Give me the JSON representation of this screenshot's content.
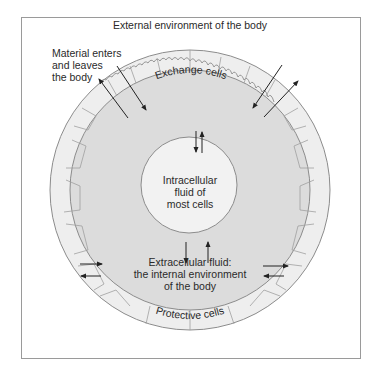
{
  "title": "External environment of the body",
  "labels": {
    "material_line1": "Material enters",
    "material_line2": "and leaves",
    "material_line3": "the body",
    "exchange_cells": "Exchange cells",
    "intracellular_line1": "Intracellular",
    "intracellular_line2": "fluid of",
    "intracellular_line3": "most cells",
    "extracellular_line1": "Extracellular fluid:",
    "extracellular_line2": "the internal environment",
    "extracellular_line3": "of the body",
    "protective_cells": "Protective cells"
  },
  "colors": {
    "frame_border": "#9a9a9a",
    "cell_layer_fill": "#eeeeee",
    "extracellular_fill": "#dcdcdc",
    "intracellular_fill": "#f2f2f2",
    "outline": "#8c8c8c",
    "arrow": "#222222"
  }
}
